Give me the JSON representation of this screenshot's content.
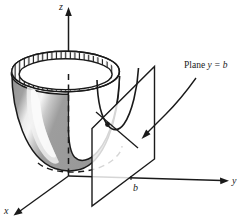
{
  "figure": {
    "kind": "3d-math-diagram",
    "background_color": "#ffffff",
    "ink_color": "#1a1a1a"
  },
  "axes": {
    "z": {
      "label": "z",
      "direction": "up"
    },
    "y": {
      "label": "y",
      "direction": "right"
    },
    "x": {
      "label": "x",
      "direction": "down-left"
    },
    "origin_label": ""
  },
  "ticks": {
    "b": {
      "label": "b",
      "axis": "y"
    }
  },
  "annotations": {
    "plane": {
      "prefix": "Plane",
      "equation": "y = b",
      "full": "Plane y = b",
      "arrow": "curved-arrow-pointing-left-down"
    }
  },
  "surface": {
    "name": "paraboloid",
    "body_fill": "#9a9a9a",
    "highlight_fill": "#f2f2f2",
    "interior_fill": "#ffffff",
    "rim_fill": "#ffffff",
    "rim_hatch": "vertical-hatch",
    "outline_color": "#1a1a1a"
  },
  "plane": {
    "name": "cutting-plane",
    "fill": "#ffffff",
    "opacity": "translucent",
    "outline_color": "#1a1a1a"
  },
  "curves": {
    "cross_section": "parabola",
    "hidden_style": "dashed",
    "pointer_line": "leader-line-to-parabola"
  }
}
